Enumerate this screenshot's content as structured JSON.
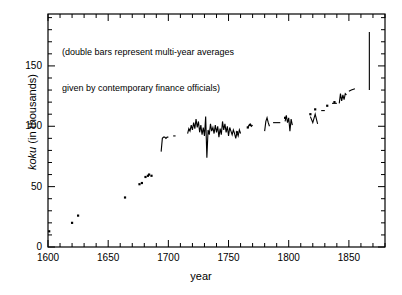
{
  "chart_data": {
    "type": "line",
    "title": "",
    "xlabel": "year",
    "ylabel_prefix": "koku",
    "ylabel_suffix": " (in thousands)",
    "ylabel_full": "koku (in thousands)",
    "xlim": [
      1600,
      1880
    ],
    "ylim": [
      0,
      193
    ],
    "xticks": [
      1600,
      1650,
      1700,
      1750,
      1800,
      1850
    ],
    "xtick_labels": [
      "1600",
      "1650",
      "1700",
      "1750",
      "1800",
      "1850"
    ],
    "x_minor_step": 10,
    "yticks": [
      0,
      50,
      100,
      150
    ],
    "ytick_labels": [
      "0",
      "50",
      "100",
      "150"
    ],
    "y_minor_step": 10,
    "grid": false,
    "legend": "none",
    "line_color": "#000000",
    "annotations": [
      {
        "name": "double-bars-note",
        "line1": "(double bars represent multi-year averages",
        "line2": "given by contemporary finance officials)",
        "x": 1612,
        "y": 178
      }
    ],
    "markers": [
      {
        "x": 1601,
        "y": 13
      },
      {
        "x": 1620,
        "y": 20
      },
      {
        "x": 1625,
        "y": 26
      },
      {
        "x": 1664,
        "y": 41
      },
      {
        "x": 1676,
        "y": 52
      },
      {
        "x": 1678,
        "y": 53
      },
      {
        "x": 1681,
        "y": 58
      },
      {
        "x": 1683,
        "y": 59
      },
      {
        "x": 1684,
        "y": 60
      },
      {
        "x": 1686,
        "y": 59
      },
      {
        "x": 1757,
        "y": 95
      },
      {
        "x": 1766,
        "y": 99
      },
      {
        "x": 1768,
        "y": 101
      },
      {
        "x": 1797,
        "y": 107
      },
      {
        "x": 1818,
        "y": 110
      },
      {
        "x": 1822,
        "y": 114
      },
      {
        "x": 1832,
        "y": 117
      },
      {
        "x": 1838,
        "y": 120
      }
    ],
    "segments": [
      {
        "name": "seg-1694-1700",
        "x": [
          1694,
          1695,
          1696,
          1697,
          1698,
          1699,
          1700
        ],
        "y": [
          79,
          90,
          91,
          91,
          90,
          91,
          91
        ]
      },
      {
        "name": "seg-1704-1706",
        "x": [
          1704,
          1706
        ],
        "y": [
          92,
          92
        ]
      },
      {
        "name": "seg-1716-1760",
        "x": [
          1716,
          1717,
          1718,
          1719,
          1720,
          1721,
          1722,
          1723,
          1724,
          1725,
          1726,
          1727,
          1728,
          1729,
          1730,
          1731,
          1732,
          1733,
          1734,
          1735,
          1736,
          1737,
          1738,
          1739,
          1740,
          1741,
          1742,
          1743,
          1744,
          1745,
          1746,
          1747,
          1748,
          1749,
          1750,
          1751,
          1752,
          1753,
          1754,
          1755,
          1756,
          1757,
          1758,
          1759,
          1760
        ],
        "y": [
          94,
          98,
          96,
          101,
          97,
          103,
          98,
          106,
          99,
          104,
          95,
          101,
          93,
          99,
          92,
          108,
          74,
          97,
          93,
          102,
          96,
          99,
          94,
          101,
          95,
          100,
          91,
          98,
          93,
          104,
          97,
          102,
          95,
          100,
          92,
          99,
          96,
          93,
          97,
          94,
          90,
          95,
          92,
          97,
          94
        ]
      },
      {
        "name": "seg-1766-1770",
        "x": [
          1766,
          1767,
          1768,
          1769,
          1770
        ],
        "y": [
          99,
          101,
          102,
          100,
          101
        ]
      },
      {
        "name": "seg-1780-1784",
        "x": [
          1780,
          1781,
          1782,
          1783,
          1784
        ],
        "y": [
          96,
          104,
          107,
          103,
          100
        ]
      },
      {
        "name": "seg-1787-1793",
        "x": [
          1787,
          1790,
          1793
        ],
        "y": [
          103,
          103,
          103
        ]
      },
      {
        "name": "seg-1797-1803",
        "x": [
          1797,
          1798,
          1799,
          1800,
          1801,
          1802,
          1803
        ],
        "y": [
          104,
          109,
          103,
          107,
          96,
          106,
          101
        ]
      },
      {
        "name": "seg-1818-1824",
        "x": [
          1818,
          1820,
          1822,
          1824
        ],
        "y": [
          108,
          103,
          110,
          102
        ]
      },
      {
        "name": "seg-1827-1830",
        "x": [
          1827,
          1830
        ],
        "y": [
          113,
          113
        ]
      },
      {
        "name": "seg-1836-1840",
        "x": [
          1836,
          1838,
          1840
        ],
        "y": [
          119,
          119,
          119
        ]
      },
      {
        "name": "seg-1842-1848",
        "x": [
          1842,
          1843,
          1844,
          1845,
          1846,
          1847,
          1848
        ],
        "y": [
          119,
          127,
          121,
          126,
          122,
          127,
          126
        ]
      },
      {
        "name": "seg-1850-1855",
        "x": [
          1850,
          1852,
          1855
        ],
        "y": [
          129,
          130,
          131
        ]
      },
      {
        "name": "spike-1867",
        "x": [
          1867,
          1867
        ],
        "y": [
          130,
          178
        ]
      }
    ]
  }
}
